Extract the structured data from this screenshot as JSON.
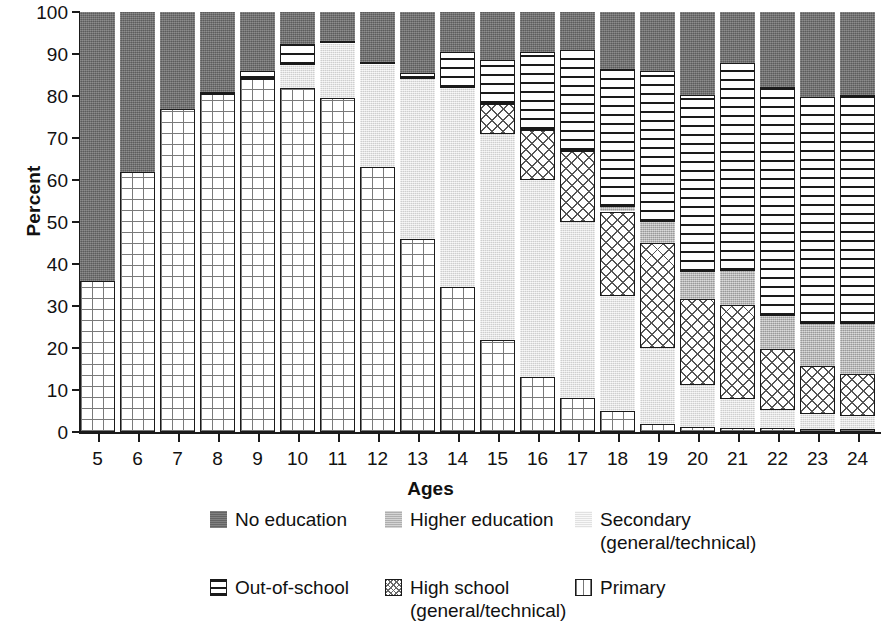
{
  "chart_data": {
    "type": "bar",
    "stacked": true,
    "title": "",
    "xlabel": "Ages",
    "ylabel": "Percent",
    "ylim": [
      0,
      100
    ],
    "yticks": [
      0,
      10,
      20,
      30,
      40,
      50,
      60,
      70,
      80,
      90,
      100
    ],
    "grid": false,
    "legend_position": "bottom",
    "categories": [
      "5",
      "6",
      "7",
      "8",
      "9",
      "10",
      "11",
      "12",
      "13",
      "14",
      "15",
      "16",
      "17",
      "18",
      "19",
      "20",
      "21",
      "22",
      "23",
      "24"
    ],
    "series": [
      {
        "name": "Primary",
        "key": "primary",
        "pattern": "fine-grid",
        "color": "#ffffff",
        "values": [
          36.0,
          62.0,
          77.0,
          80.5,
          84.0,
          82.0,
          79.5,
          63.0,
          46.0,
          34.5,
          22.0,
          13.0,
          8.0,
          5.0,
          2.0,
          1.2,
          1.0,
          1.0,
          0.8,
          0.8
        ]
      },
      {
        "name": "Secondary (general/technical)",
        "key": "secondary",
        "pattern": "light-stipple",
        "color": "#e2e2e2",
        "values": [
          0.0,
          0.0,
          0.0,
          0.0,
          0.0,
          5.5,
          13.0,
          24.5,
          38.0,
          47.5,
          49.0,
          47.0,
          42.0,
          27.5,
          18.0,
          10.0,
          6.8,
          4.2,
          3.5,
          3.0
        ]
      },
      {
        "name": "High school (general/technical)",
        "key": "highschool",
        "pattern": "cross-hatch",
        "color": "#ffffff",
        "values": [
          0.0,
          0.0,
          0.0,
          0.0,
          0.0,
          0.0,
          0.0,
          0.0,
          0.0,
          0.0,
          7.0,
          12.0,
          17.0,
          20.0,
          25.0,
          20.5,
          22.5,
          14.5,
          11.5,
          10.0
        ]
      },
      {
        "name": "Higher education",
        "key": "higher",
        "pattern": "mid-stipple",
        "color": "#b9b9b9",
        "values": [
          0.0,
          0.0,
          0.0,
          0.0,
          0.0,
          0.0,
          0.0,
          0.0,
          0.0,
          0.0,
          0.0,
          0.0,
          0.0,
          1.0,
          5.0,
          6.5,
          8.0,
          8.0,
          10.0,
          12.0
        ]
      },
      {
        "name": "Out-of-school",
        "key": "outschool",
        "pattern": "horizontal-lines",
        "color": "#ffffff",
        "values": [
          0.0,
          0.0,
          0.0,
          0.5,
          2.0,
          5.0,
          0.5,
          0.5,
          1.5,
          8.5,
          10.5,
          18.5,
          24.0,
          33.0,
          36.0,
          42.0,
          49.5,
          54.5,
          54.0,
          54.5
        ]
      },
      {
        "name": "No education",
        "key": "noedu",
        "pattern": "dark-stipple",
        "color": "#6f6f6f",
        "values": [
          64.0,
          38.0,
          23.0,
          19.0,
          14.0,
          7.5,
          7.0,
          12.0,
          14.5,
          9.5,
          11.5,
          9.5,
          9.0,
          13.5,
          14.0,
          19.8,
          12.2,
          17.8,
          20.2,
          19.7
        ]
      }
    ],
    "stack_order_bottom_to_top": [
      "primary",
      "secondary",
      "highschool",
      "higher",
      "outschool",
      "noedu"
    ]
  },
  "legend": {
    "rows": [
      [
        {
          "key": "noedu",
          "label": "No education"
        },
        {
          "key": "higher",
          "label": "Higher education"
        },
        {
          "key": "secondary",
          "label": "Secondary\n(general/technical)"
        }
      ],
      [
        {
          "key": "outschool",
          "label": "Out-of-school"
        },
        {
          "key": "highschool",
          "label": "High school\n(general/technical)"
        },
        {
          "key": "primary",
          "label": "Primary"
        }
      ]
    ]
  }
}
